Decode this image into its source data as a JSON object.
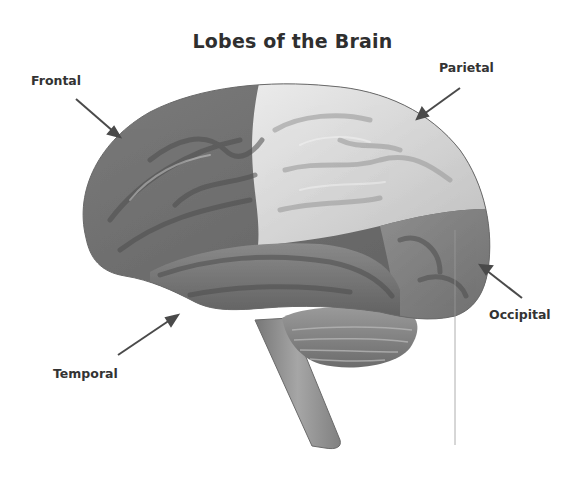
{
  "diagram": {
    "title": "Lobes of the Brain",
    "labels": {
      "frontal": "Frontal",
      "parietal": "Parietal",
      "occipital": "Occipital",
      "temporal": "Temporal"
    },
    "colors": {
      "frontal": "#6f6f6f",
      "parietal": "#d8d8d8",
      "temporal": "#7a7a7a",
      "occipital": "#808080",
      "cerebellum": "#8a8a8a",
      "brainstem": "#8c8c8c",
      "arrow": "#4a4a4a",
      "text": "#333333"
    }
  }
}
